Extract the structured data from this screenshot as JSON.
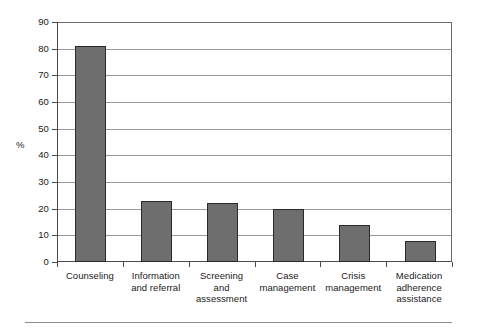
{
  "chart_data": {
    "type": "bar",
    "title": "",
    "subtitle": "",
    "xlabel": "",
    "ylabel": "%",
    "ylim": [
      0,
      90
    ],
    "ytick_values": [
      0,
      10,
      20,
      30,
      40,
      50,
      60,
      70,
      80,
      90
    ],
    "ytick_labels": [
      "0",
      "10",
      "20",
      "30",
      "40",
      "50",
      "60",
      "70",
      "80",
      "90"
    ],
    "grid": "horizontal",
    "legend": "none",
    "bar_color": "#6e6e6e",
    "bar_edge_color": "#2a2a2a",
    "axis_color": "#4a4a4a",
    "gridline_color": "#9a9a9a",
    "background": "#ffffff",
    "categories": [
      "Counseling",
      "Information and referral",
      "Screening and assessment",
      "Case management",
      "Crisis management",
      "Medication adherence assistance"
    ],
    "category_label_lines": [
      [
        "Counseling"
      ],
      [
        "Information",
        "and referral"
      ],
      [
        "Screening",
        "and",
        "assessment"
      ],
      [
        "Case",
        "management"
      ],
      [
        "Crisis",
        "management"
      ],
      [
        "Medication",
        "adherence",
        "assistance"
      ]
    ],
    "values": [
      81,
      23,
      22,
      20,
      14,
      8
    ]
  },
  "figure": {
    "footer_rule": "horizontal-rule"
  }
}
